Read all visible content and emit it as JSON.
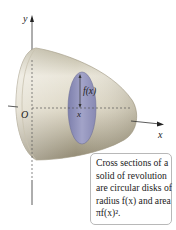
{
  "figure": {
    "axes": {
      "y_label": "y",
      "x_label": "x",
      "origin_label": "O"
    },
    "annotations": {
      "radius_label": "f(x)",
      "x_position_label": "x"
    },
    "caption": {
      "lines": [
        "Cross sections of a",
        "solid of revolution",
        "are circular disks of",
        "radius f(x) and area",
        "πf(x)²."
      ]
    },
    "colors": {
      "solid_light": "#ece8dc",
      "solid_dark": "#a79f86",
      "disk": "#8e8fb8",
      "axis": "#333333",
      "caption_border": "#b8b8b8"
    }
  }
}
